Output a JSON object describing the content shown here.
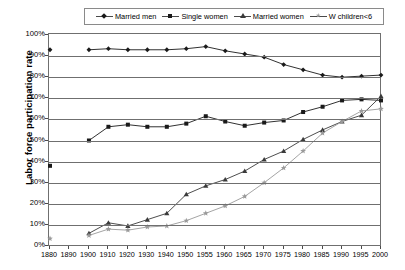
{
  "chart_data": {
    "type": "line",
    "title": "",
    "xlabel": "",
    "ylabel": "Labor force participation rate",
    "ylim": [
      0,
      100
    ],
    "ytick_labels": [
      "0%",
      "10%",
      "20%",
      "30%",
      "40%",
      "50%",
      "60%",
      "70%",
      "80%",
      "90%",
      "100%"
    ],
    "ytick_values": [
      0,
      10,
      20,
      30,
      40,
      50,
      60,
      70,
      80,
      90,
      100
    ],
    "grid": true,
    "legend_position": "top",
    "categories": [
      "1880",
      "1890",
      "1900",
      "1910",
      "1920",
      "1930",
      "1940",
      "1950",
      "1955",
      "1960",
      "1965",
      "1970",
      "1975",
      "1980",
      "1985",
      "1990",
      "1995",
      "2000"
    ],
    "series": [
      {
        "name": "Married men",
        "marker": "diamond",
        "color": "#1a1a1a",
        "values": [
          93,
          null,
          93,
          93.5,
          93,
          93,
          93,
          93.5,
          94.5,
          92.5,
          91,
          89.5,
          86,
          83.5,
          81,
          80,
          80.5,
          81
        ]
      },
      {
        "name": "Single women",
        "marker": "square",
        "color": "#1a1a1a",
        "values": [
          38,
          null,
          50,
          56.5,
          57.5,
          56.5,
          56.5,
          58,
          61.5,
          59,
          57,
          58.5,
          59.5,
          63.5,
          66,
          69,
          69.5,
          69
        ]
      },
      {
        "name": "Married women",
        "marker": "triangle",
        "color": "#3a3a3a",
        "values": [
          null,
          null,
          6,
          11,
          9.5,
          12.5,
          15.5,
          24.5,
          28.5,
          31.5,
          35.5,
          41,
          45,
          50.5,
          55,
          59,
          62,
          71
        ]
      },
      {
        "name": "W children<6",
        "marker": "star",
        "color": "#9a9a9a",
        "values": [
          3.5,
          null,
          5,
          8,
          7.5,
          9,
          9.5,
          12,
          15.5,
          19,
          23.5,
          30,
          37,
          45,
          53.5,
          59,
          64,
          65
        ]
      }
    ]
  },
  "legend": {
    "items": [
      {
        "label": "Married men",
        "marker": "diamond"
      },
      {
        "label": "Single women",
        "marker": "square"
      },
      {
        "label": "Married women",
        "marker": "triangle"
      },
      {
        "label": "W children<6",
        "marker": "star"
      }
    ]
  }
}
